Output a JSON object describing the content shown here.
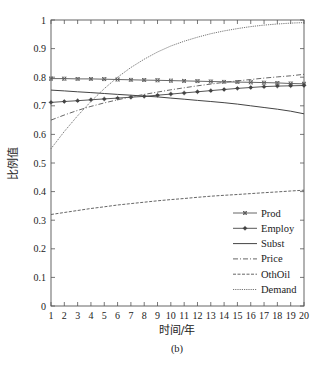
{
  "chart_data": {
    "type": "line",
    "title": "",
    "caption": "(b)",
    "xlabel": "时间/年",
    "ylabel": "比例值",
    "xlim": [
      1,
      20
    ],
    "ylim": [
      0,
      1
    ],
    "grid": false,
    "legend_position": "lower right",
    "x": [
      1,
      2,
      3,
      4,
      5,
      6,
      7,
      8,
      9,
      10,
      11,
      12,
      13,
      14,
      15,
      16,
      17,
      18,
      19,
      20
    ],
    "x_ticks": [
      "1",
      "2",
      "3",
      "4",
      "5",
      "6",
      "7",
      "8",
      "9",
      "10",
      "11",
      "12",
      "13",
      "14",
      "15",
      "16",
      "17",
      "18",
      "19",
      "20"
    ],
    "y_ticks": [
      "0",
      "0.1",
      "0.2",
      "0.3",
      "0.4",
      "0.5",
      "0.6",
      "0.7",
      "0.8",
      "0.9",
      "1"
    ],
    "series": [
      {
        "name": "Prod",
        "style": "solid-x-marker",
        "values": [
          0.795,
          0.795,
          0.794,
          0.794,
          0.793,
          0.792,
          0.791,
          0.79,
          0.789,
          0.788,
          0.787,
          0.786,
          0.785,
          0.784,
          0.783,
          0.782,
          0.781,
          0.78,
          0.778,
          0.777
        ]
      },
      {
        "name": "Employ",
        "style": "solid-star-marker",
        "values": [
          0.712,
          0.715,
          0.718,
          0.721,
          0.724,
          0.727,
          0.73,
          0.733,
          0.737,
          0.741,
          0.745,
          0.749,
          0.753,
          0.757,
          0.761,
          0.764,
          0.767,
          0.769,
          0.77,
          0.771
        ]
      },
      {
        "name": "Subst",
        "style": "solid",
        "values": [
          0.755,
          0.752,
          0.749,
          0.746,
          0.743,
          0.74,
          0.737,
          0.734,
          0.731,
          0.727,
          0.723,
          0.719,
          0.715,
          0.711,
          0.706,
          0.7,
          0.694,
          0.688,
          0.681,
          0.672
        ]
      },
      {
        "name": "Price",
        "style": "dash-dot",
        "values": [
          0.65,
          0.668,
          0.684,
          0.698,
          0.71,
          0.721,
          0.731,
          0.74,
          0.748,
          0.756,
          0.763,
          0.77,
          0.776,
          0.782,
          0.787,
          0.792,
          0.797,
          0.801,
          0.805,
          0.81
        ]
      },
      {
        "name": "OthOil",
        "style": "dashed",
        "values": [
          0.32,
          0.327,
          0.334,
          0.341,
          0.347,
          0.353,
          0.358,
          0.363,
          0.368,
          0.372,
          0.376,
          0.38,
          0.384,
          0.387,
          0.39,
          0.393,
          0.396,
          0.399,
          0.402,
          0.405
        ]
      },
      {
        "name": "Demand",
        "style": "dotted",
        "values": [
          0.55,
          0.61,
          0.665,
          0.715,
          0.76,
          0.8,
          0.834,
          0.863,
          0.888,
          0.909,
          0.926,
          0.94,
          0.952,
          0.962,
          0.97,
          0.977,
          0.982,
          0.986,
          0.989,
          0.991
        ]
      }
    ]
  },
  "legend": {
    "items": [
      "Prod",
      "Employ",
      "Subst",
      "Price",
      "OthOil",
      "Demand"
    ]
  }
}
